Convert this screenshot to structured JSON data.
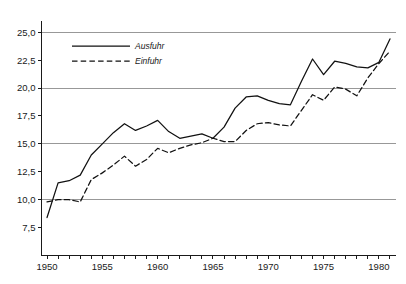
{
  "chart_data": {
    "type": "line",
    "title": "",
    "subtitle": "",
    "xlabel": "",
    "ylabel": "",
    "xlim": [
      1949.5,
      1981.5
    ],
    "ylim": [
      5.0,
      25.6
    ],
    "grid": true,
    "grid_values": [
      10.0,
      15.0,
      20.0,
      25.0
    ],
    "legend_position": "upper-left-inside",
    "y_ticks": [
      {
        "value": 7.5,
        "label": "7,5"
      },
      {
        "value": 10.0,
        "label": "10,0"
      },
      {
        "value": 12.5,
        "label": "12,5"
      },
      {
        "value": 15.0,
        "label": "15,0"
      },
      {
        "value": 17.5,
        "label": "17,5"
      },
      {
        "value": 20.0,
        "label": "20,0"
      },
      {
        "value": 22.5,
        "label": "22,5"
      },
      {
        "value": 25.0,
        "label": "25,0"
      }
    ],
    "x_ticks": [
      1950,
      1951,
      1952,
      1953,
      1954,
      1955,
      1956,
      1957,
      1958,
      1959,
      1960,
      1961,
      1962,
      1963,
      1964,
      1965,
      1966,
      1967,
      1968,
      1969,
      1970,
      1971,
      1972,
      1973,
      1974,
      1975,
      1976,
      1977,
      1978,
      1979,
      1980,
      1981
    ],
    "x_tick_labels": [
      {
        "value": 1950,
        "label": "1950"
      },
      {
        "value": 1955,
        "label": "1955"
      },
      {
        "value": 1960,
        "label": "1960"
      },
      {
        "value": 1965,
        "label": "1965"
      },
      {
        "value": 1970,
        "label": "1970"
      },
      {
        "value": 1975,
        "label": "1975"
      },
      {
        "value": 1980,
        "label": "1980"
      }
    ],
    "x": [
      1950,
      1951,
      1952,
      1953,
      1954,
      1955,
      1956,
      1957,
      1958,
      1959,
      1960,
      1961,
      1962,
      1963,
      1964,
      1965,
      1966,
      1967,
      1968,
      1969,
      1970,
      1971,
      1972,
      1973,
      1974,
      1975,
      1976,
      1977,
      1978,
      1979,
      1980,
      1981
    ],
    "series": [
      {
        "name": "Ausfuhr",
        "style": "solid",
        "color": "#111111",
        "values": [
          8.4,
          11.5,
          11.7,
          12.2,
          14.0,
          15.0,
          16.0,
          16.8,
          16.2,
          16.6,
          17.1,
          16.1,
          15.5,
          15.7,
          15.9,
          15.5,
          16.5,
          18.2,
          19.2,
          19.3,
          18.9,
          18.6,
          18.5,
          20.6,
          22.6,
          21.2,
          22.4,
          22.2,
          21.9,
          21.8,
          22.3,
          24.4
        ]
      },
      {
        "name": "Einfuhr",
        "style": "dashed",
        "color": "#111111",
        "values": [
          9.8,
          10.0,
          10.0,
          9.8,
          11.8,
          12.4,
          13.1,
          13.9,
          13.0,
          13.6,
          14.6,
          14.2,
          14.6,
          14.9,
          15.1,
          15.5,
          15.2,
          15.2,
          16.2,
          16.8,
          16.9,
          16.7,
          16.6,
          18.0,
          19.4,
          18.9,
          20.1,
          19.9,
          19.3,
          20.9,
          22.2,
          23.3
        ]
      }
    ]
  },
  "legend": {
    "entries": [
      {
        "label": "Ausfuhr",
        "style": "solid"
      },
      {
        "label": "Einfuhr",
        "style": "dashed"
      }
    ]
  },
  "colors": {
    "axis": "#1a1a1a",
    "grid": "#8d8d8d",
    "line": "#111111",
    "background": "#ffffff"
  }
}
